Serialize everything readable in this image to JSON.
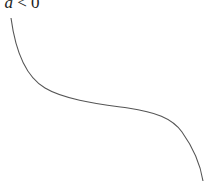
{
  "label": {
    "prefix": ". ",
    "variable": "a",
    "relation": " < 0"
  },
  "curve": {
    "description": "decreasing cubic-like curve",
    "stroke": "#555555",
    "points": [
      [
        11,
        18
      ],
      [
        40,
        85
      ],
      [
        100,
        105
      ],
      [
        140,
        111
      ],
      [
        175,
        126
      ],
      [
        203,
        180
      ]
    ]
  }
}
